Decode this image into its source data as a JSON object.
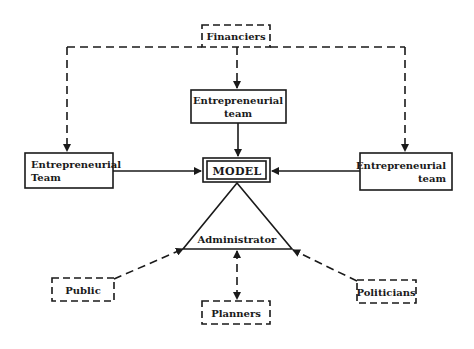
{
  "diagram": {
    "nodes": {
      "financiers": {
        "label": "Financiers",
        "style": "dashed"
      },
      "center_team": {
        "line1": "Entrepreneurial",
        "line2": "team",
        "style": "solid"
      },
      "left_team": {
        "line1": "Entrepreneurial",
        "line2": "Team",
        "style": "solid"
      },
      "right_team": {
        "line1": "Entrepreneurial",
        "line2": "team",
        "style": "solid"
      },
      "model": {
        "label": "MODEL",
        "style": "double"
      },
      "administrator": {
        "label": "Administrator",
        "shape": "triangle"
      },
      "public": {
        "label": "Public",
        "style": "dashed"
      },
      "planners": {
        "label": "Planners",
        "style": "dashed"
      },
      "politicians": {
        "label": "Politicians",
        "style": "dashed"
      }
    },
    "edges": [
      {
        "from": "Financiers",
        "to": "Entrepreneurial team (center)",
        "style": "dashed",
        "arrow": "end"
      },
      {
        "from": "Financiers",
        "to": "Entrepreneurial Team (left)",
        "style": "dashed",
        "arrow": "end"
      },
      {
        "from": "Financiers",
        "to": "Entrepreneurial team (right)",
        "style": "dashed",
        "arrow": "end"
      },
      {
        "from": "Entrepreneurial team (center)",
        "to": "MODEL",
        "style": "solid",
        "arrow": "end"
      },
      {
        "from": "Entrepreneurial Team (left)",
        "to": "MODEL",
        "style": "solid",
        "arrow": "end"
      },
      {
        "from": "Entrepreneurial team (right)",
        "to": "MODEL",
        "style": "solid",
        "arrow": "end"
      },
      {
        "from": "MODEL",
        "to": "Administrator",
        "style": "solid",
        "arrow": "none"
      },
      {
        "from": "Public",
        "to": "Administrator",
        "style": "dashed",
        "arrow": "end"
      },
      {
        "from": "Politicians",
        "to": "Administrator",
        "style": "dashed",
        "arrow": "end"
      },
      {
        "from": "Planners",
        "to": "Administrator",
        "style": "dashed",
        "arrow": "both"
      }
    ],
    "colors": {
      "ink": "#1a1a1a",
      "background": "#ffffff"
    }
  }
}
